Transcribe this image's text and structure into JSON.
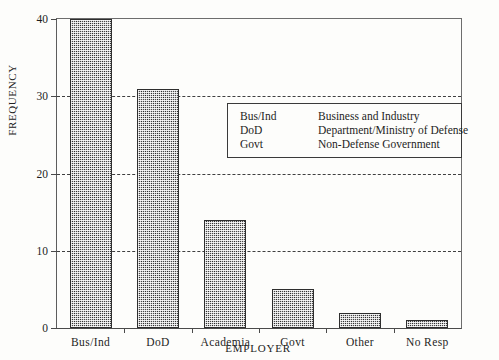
{
  "chart_data": {
    "type": "bar",
    "title": "",
    "xlabel": "EMPLOYER",
    "ylabel": "FREQUENCY",
    "categories": [
      "Bus/Ind",
      "DoD",
      "Academia",
      "Govt",
      "Other",
      "No Resp"
    ],
    "values": [
      40,
      31,
      14,
      5,
      2,
      1
    ],
    "ylim": [
      0,
      40
    ],
    "ytick_labels": [
      "0",
      "10",
      "20",
      "30",
      "40"
    ],
    "ytick_values": [
      0,
      10,
      20,
      30,
      40
    ],
    "grid": "horizontal-dashed",
    "legend_position": "inside-upper-right",
    "bar_fill": "#4a4a4a",
    "axis_color": "#4a4a4a",
    "background": "#fdfdfb"
  },
  "legend": {
    "rows": [
      {
        "abbr": "Bus/Ind",
        "desc": "Business and Industry"
      },
      {
        "abbr": "DoD",
        "desc": "Department/Ministry of Defense"
      },
      {
        "abbr": "Govt",
        "desc": "Non-Defense Government"
      }
    ]
  }
}
